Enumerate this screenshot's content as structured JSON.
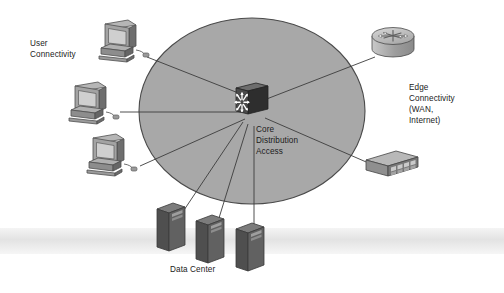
{
  "diagram": {
    "type": "network-topology",
    "canvas": {
      "width": 504,
      "height": 293
    },
    "background_color": "#ffffff",
    "scan_band": {
      "name": "scan-artifact-band",
      "color": "#e6e6e6",
      "y": 228,
      "height": 26
    }
  },
  "cloud": {
    "name": "campus-network-cloud",
    "shape": "ellipse",
    "cx": 252,
    "cy": 111,
    "rx": 113,
    "ry": 93,
    "fill": "#a8a8a8",
    "stroke": "#4a4a4a"
  },
  "labels": {
    "user_connectivity": "User\nConnectivity",
    "core_distribution_access": "Core\nDistribution\nAccess",
    "edge_connectivity": "Edge\nConnectivity\n(WAN,\nInternet)",
    "data_center": "Data Center"
  },
  "nodes": [
    {
      "id": "switch-core",
      "name": "multilayer-switch-icon",
      "device_type": "multilayer-switch",
      "label": "Core Distribution Access",
      "x": 252,
      "y": 99,
      "arrow_count": 8,
      "body_color": "#3a3a3a",
      "arrow_color": "#ffffff"
    },
    {
      "id": "pc-1",
      "name": "workstation-icon",
      "device_type": "desktop-computer",
      "x": 112,
      "y": 42,
      "body_color": "#9a9a9a"
    },
    {
      "id": "pc-2",
      "name": "workstation-icon",
      "device_type": "desktop-computer",
      "x": 85,
      "y": 104,
      "body_color": "#9a9a9a"
    },
    {
      "id": "pc-3",
      "name": "workstation-icon",
      "device_type": "desktop-computer",
      "x": 105,
      "y": 157,
      "body_color": "#9a9a9a"
    },
    {
      "id": "router-edge",
      "name": "router-icon",
      "device_type": "router",
      "label": "Edge Connectivity (WAN, Internet)",
      "x": 394,
      "y": 45,
      "body_color": "#b4b4b4"
    },
    {
      "id": "switch-workgroup",
      "name": "workgroup-switch-icon",
      "device_type": "workgroup-switch",
      "x": 394,
      "y": 170,
      "body_color": "#a0a0a0"
    },
    {
      "id": "server-1",
      "name": "server-icon",
      "device_type": "tower-server",
      "x": 170,
      "y": 228,
      "body_color": "#5d5d5d"
    },
    {
      "id": "server-2",
      "name": "server-icon",
      "device_type": "tower-server",
      "x": 208,
      "y": 238,
      "body_color": "#5d5d5d"
    },
    {
      "id": "server-3",
      "name": "server-icon",
      "device_type": "tower-server",
      "x": 248,
      "y": 245,
      "body_color": "#5d5d5d"
    }
  ],
  "links": [
    {
      "name": "link-pc1-core",
      "from": "pc-1",
      "to": "switch-core"
    },
    {
      "name": "link-pc2-core",
      "from": "pc-2",
      "to": "switch-core"
    },
    {
      "name": "link-pc3-core",
      "from": "pc-3",
      "to": "switch-core"
    },
    {
      "name": "link-router-core",
      "from": "router-edge",
      "to": "switch-core"
    },
    {
      "name": "link-wgswitch-core",
      "from": "switch-workgroup",
      "to": "switch-core"
    },
    {
      "name": "link-server1-core",
      "from": "server-1",
      "to": "switch-core"
    },
    {
      "name": "link-server2-core",
      "from": "server-2",
      "to": "switch-core"
    },
    {
      "name": "link-server3-core",
      "from": "server-3",
      "to": "switch-core"
    }
  ],
  "link_style": {
    "color": "#3c3c3c",
    "width": 0.9
  }
}
